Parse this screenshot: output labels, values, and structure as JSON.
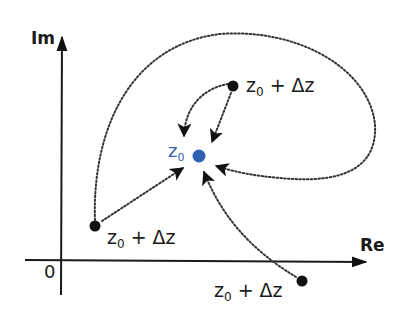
{
  "diagram": {
    "axes": {
      "x_label": "Re",
      "y_label": "Im",
      "origin_label": "0"
    },
    "center_point": {
      "label_main": "z",
      "label_sub": "0",
      "color": "#2f5fb0",
      "position": [
        199,
        156
      ]
    },
    "approach_points": [
      {
        "label_main": "z",
        "label_sub": "0",
        "label_rest": " + Δz",
        "position": [
          233,
          86
        ]
      },
      {
        "label_main": "z",
        "label_sub": "0",
        "label_rest": " + Δz",
        "position": [
          95,
          226
        ]
      },
      {
        "label_main": "z",
        "label_sub": "0",
        "label_rest": " + Δz",
        "position": [
          302,
          281
        ]
      }
    ],
    "colors": {
      "axis": "#1a1a1a",
      "paths": "#333333",
      "center": "#2f5fb0",
      "points": "#111111"
    }
  }
}
